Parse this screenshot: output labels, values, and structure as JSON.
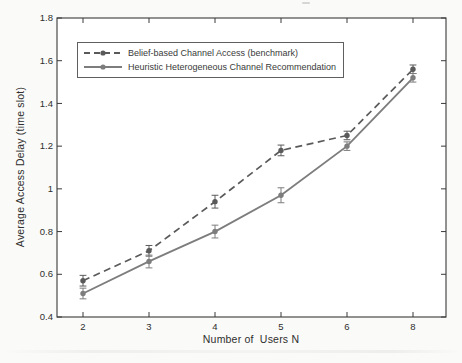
{
  "chart_data": {
    "type": "line",
    "xlabel": "Number of  Users N",
    "ylabel": "Average Access Delay (time slot)",
    "categories": [
      2,
      3,
      4,
      5,
      6,
      8
    ],
    "x_tick_labels": [
      "2",
      "3",
      "4",
      "5",
      "6",
      "8"
    ],
    "y_ticks": [
      0.4,
      0.6,
      0.8,
      1,
      1.2,
      1.4,
      1.6,
      1.8
    ],
    "y_tick_labels": [
      "0.4",
      "0.6",
      "0.8",
      "1",
      "1.2",
      "1.4",
      "1.6",
      "1.8"
    ],
    "ylim": [
      0.4,
      1.8
    ],
    "grid": false,
    "legend_position": "top-left",
    "axis_color": "#3a3a3a",
    "tick_label_color": "#2e2e2e",
    "plot_background": "#ffffff",
    "series": [
      {
        "name": "Belief-based Channel Access (benchmark)",
        "line_style": "dashed",
        "marker": "circle",
        "color": "#5a5a5a",
        "values": [
          0.57,
          0.71,
          0.94,
          1.18,
          1.25,
          1.56
        ],
        "errors": [
          0.025,
          0.025,
          0.03,
          0.025,
          0.02,
          0.02
        ]
      },
      {
        "name": "Heuristic Heterogeneous Channel Recommendation",
        "line_style": "solid",
        "marker": "circle",
        "color": "#7d7d7d",
        "values": [
          0.51,
          0.66,
          0.8,
          0.97,
          1.2,
          1.52
        ],
        "errors": [
          0.025,
          0.03,
          0.03,
          0.035,
          0.02,
          0.02
        ]
      }
    ]
  }
}
